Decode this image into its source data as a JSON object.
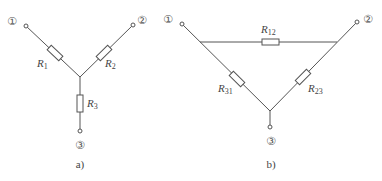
{
  "diagram_a": {
    "caption": "a)",
    "type": "Y (star) connection",
    "terminals": [
      {
        "id": "1",
        "label": "①"
      },
      {
        "id": "2",
        "label": "②"
      },
      {
        "id": "3",
        "label": "③"
      }
    ],
    "resistors": [
      {
        "name": "R",
        "sub": "1"
      },
      {
        "name": "R",
        "sub": "2"
      },
      {
        "name": "R",
        "sub": "3"
      }
    ]
  },
  "diagram_b": {
    "caption": "b)",
    "type": "Δ (delta) connection",
    "terminals": [
      {
        "id": "1",
        "label": "①"
      },
      {
        "id": "2",
        "label": "②"
      },
      {
        "id": "3",
        "label": "③"
      }
    ],
    "resistors": [
      {
        "name": "R",
        "sub": "12"
      },
      {
        "name": "R",
        "sub": "31"
      },
      {
        "name": "R",
        "sub": "23"
      }
    ]
  },
  "colors": {
    "line": "#555555",
    "text": "#444444",
    "background": "#ffffff"
  }
}
